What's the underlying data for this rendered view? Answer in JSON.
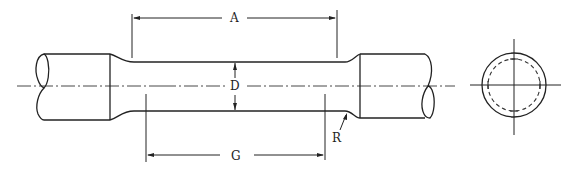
{
  "diagram": {
    "type": "tensile test specimen drawing",
    "views": [
      "side-view",
      "end-view"
    ],
    "labels": {
      "A": "A",
      "D": "D",
      "G": "G",
      "R": "R"
    },
    "dimensions": [
      {
        "label": "A",
        "meaning": "length of reduced section"
      },
      {
        "label": "D",
        "meaning": "diameter of reduced section"
      },
      {
        "label": "G",
        "meaning": "gauge length"
      },
      {
        "label": "R",
        "meaning": "fillet radius"
      }
    ],
    "colors": {
      "line": "#222222",
      "background": "#ffffff"
    }
  }
}
